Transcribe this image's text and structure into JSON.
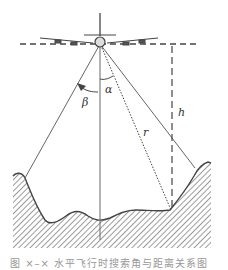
{
  "figure": {
    "labels": {
      "alpha": "α",
      "beta": "β",
      "range": "r",
      "height": "h"
    },
    "caption": "图 ×–× 水平飞行时搜索角与距离关系图",
    "elements": {
      "aircraft": "airplane-front-view",
      "flight_level": "dashed-horizontal-line",
      "nadir": "vertical-line",
      "beam_left": "solid-line",
      "beam_right": "solid-line",
      "slant_range": "dotted-line",
      "altitude": "dashed-vertical-line",
      "terrain": "hatched-ground"
    },
    "colors": {
      "line": "#555555",
      "hatch": "#666666",
      "background": "#ffffff"
    }
  }
}
